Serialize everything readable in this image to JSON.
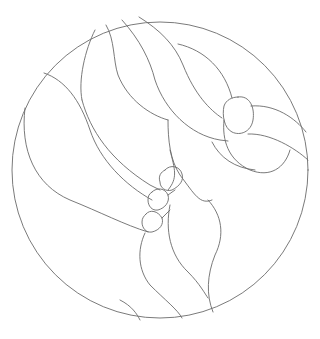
{
  "image": {
    "description": "Line-art stained glass pattern inside a circle: swirling ribbon/leaf bands, an oval knot at upper right, and three small stacked hearts near the center.",
    "background_color": "#ffffff",
    "line_color": "#6b6b6b",
    "shapes": {
      "outer_circle": "circle",
      "ribbon_bands": "swirling-bands",
      "knot_oval": "oval",
      "hearts": [
        "heart-top",
        "heart-middle",
        "heart-bottom"
      ],
      "lower_lobes": "teardrop-lobes"
    }
  }
}
